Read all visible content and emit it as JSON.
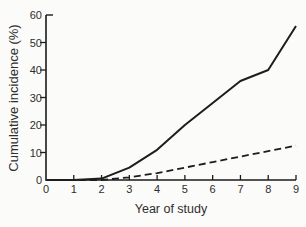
{
  "figure": {
    "background": "#fbfbf9",
    "line_color": "#1d1d1d",
    "axis_color": "#1b1b1b",
    "text_color": "#2e2e2e"
  },
  "chart_data": {
    "type": "line",
    "title": "",
    "xlabel": "Year of study",
    "ylabel": "Cumulative incidence (%)",
    "x": [
      0,
      1,
      2,
      3,
      4,
      5,
      6,
      7,
      8,
      9
    ],
    "xlim": [
      0,
      9
    ],
    "ylim": [
      0,
      60
    ],
    "xticks": [
      0,
      1,
      2,
      3,
      4,
      5,
      6,
      7,
      8,
      9
    ],
    "yticks": [
      0,
      10,
      20,
      30,
      40,
      50,
      60
    ],
    "grid": false,
    "legend": "none",
    "series": [
      {
        "name": "solid-series-line",
        "style": "solid",
        "values": [
          0,
          0,
          0.5,
          4.5,
          11,
          20,
          28,
          36,
          40,
          56
        ]
      },
      {
        "name": "dashed-series-line",
        "style": "dashed",
        "values": [
          0,
          0,
          0,
          1,
          2.5,
          4.5,
          6.5,
          8.5,
          10.5,
          12.5
        ]
      }
    ]
  }
}
